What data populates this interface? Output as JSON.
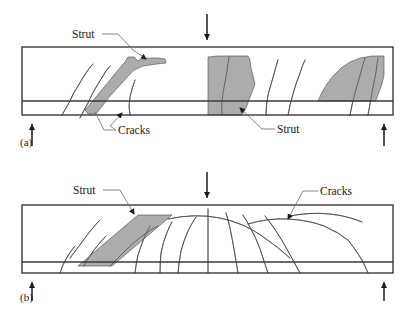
{
  "figure": {
    "type": "engineering-diagram",
    "colors": {
      "strut_fill": "#a8a8a8",
      "strut_stroke": "#4a4a4a",
      "beam_outline": "#3a3a3a",
      "crack_line": "#5a5a5a",
      "arrow": "#1a1a1a",
      "leader": "#6a6a6a",
      "text": "#1a1a1a",
      "background": "#ffffff"
    },
    "panels": [
      {
        "id": "a",
        "caption": "(a)",
        "caption_x": 20,
        "caption_y": 146,
        "beam": {
          "x": 22,
          "y": 47,
          "width": 371,
          "height": 68,
          "rebar_y": 101
        },
        "load_arrow": {
          "x": 207,
          "y_top": 14,
          "y_bottom": 46
        },
        "supports": [
          {
            "x": 32,
            "y_top": 146,
            "y_bottom": 118
          },
          {
            "x": 384,
            "y_top": 146,
            "y_bottom": 118
          }
        ],
        "labels": [
          {
            "text": "Strut",
            "x": 72,
            "y": 38,
            "name": "strut-label-a-top",
            "leader": "M102,34 L118,34 L133,50 L146,59"
          },
          {
            "text": "Cracks",
            "x": 118,
            "y": 134,
            "name": "cracks-label-a",
            "leader": "M116,130 L104,130 L95,112 M116,130 L110,126 L122,113"
          },
          {
            "text": "Strut",
            "x": 277,
            "y": 133,
            "name": "strut-label-a-bottom",
            "leader": "M275,129 L262,129 L240,108"
          }
        ],
        "struts": [
          {
            "name": "strut-band-left",
            "path": "M88,114 L96,114 L110,96 L121,84 L128,76 L134,70 L143,66 L150,65 L157,64 L166,63 L165,59 L159,58 L150,58 L142,59 L138,61 L134,57 L128,57 L125,62 L118,70 L110,80 L100,92 L92,102 L85,110 Z"
          },
          {
            "name": "strut-band-middle",
            "path": "M208,57 L208,115 L242,115 L246,108 L249,100 L252,92 L255,84 L253,76 L251,68 L250,60 L248,56 L238,56 L228,56 L218,56 Z"
          },
          {
            "name": "strut-band-right",
            "path": "M318,101 L322,92 L327,84 L333,76 L341,68 L350,62 L360,58 L372,56 L384,56 L384,75 L382,84 L379,92 L376,100 L374,101 Z"
          }
        ],
        "cracks": [
          {
            "name": "crack-a-1",
            "path": "M62,115 Q66,108 70,101 Q73,93 78,86 Q82,79 86,73 Q89,68 93,64"
          },
          {
            "name": "crack-a-2",
            "path": "M80,118 Q84,110 88,103 Q91,96 95,89 Q99,82 103,76 Q106,70 110,66"
          },
          {
            "name": "crack-a-3",
            "path": "M130,115 Q128,106 130,97 Q132,88 135,80"
          },
          {
            "name": "crack-a-4",
            "path": "M222,115 Q221,104 223,93 Q225,82 227,71 Q228,63 229,57"
          },
          {
            "name": "crack-a-5",
            "path": "M266,115 Q266,105 268,95 Q271,84 274,74 Q276,66 278,60"
          },
          {
            "name": "crack-a-6",
            "path": "M288,115 Q290,104 293,94 Q296,83 300,73 Q302,66 305,60"
          },
          {
            "name": "crack-a-7",
            "path": "M350,115 Q352,104 355,93 Q358,82 361,72 Q363,64 365,58"
          },
          {
            "name": "crack-a-8",
            "path": "M368,115 Q370,104 372,93 Q374,82 376,72 Q377,64 378,58"
          }
        ]
      },
      {
        "id": "b",
        "caption": "(b)",
        "caption_x": 20,
        "caption_y": 301,
        "beam": {
          "x": 22,
          "y": 205,
          "width": 371,
          "height": 68,
          "rebar_y": 262
        },
        "load_arrow": {
          "x": 207,
          "y_top": 172,
          "y_bottom": 204
        },
        "supports": [
          {
            "x": 32,
            "y_top": 301,
            "y_bottom": 276
          },
          {
            "x": 384,
            "y_top": 301,
            "y_bottom": 276
          }
        ],
        "labels": [
          {
            "text": "Strut",
            "x": 73,
            "y": 194,
            "name": "strut-label-b",
            "leader": "M103,190 L120,190 L134,214"
          },
          {
            "text": "Cracks",
            "x": 320,
            "y": 195,
            "name": "cracks-label-b",
            "leader": "M318,191 L303,191 L288,219"
          }
        ],
        "struts": [
          {
            "name": "strut-parallelogram-b",
            "path": "M78,266 L138,215 L172,215 L112,266 Z"
          }
        ],
        "cracks": [
          {
            "name": "crack-b-fan-1",
            "path": "M60,273 Q62,266 66,259 Q70,252 75,246"
          },
          {
            "name": "crack-b-fan-2",
            "path": "M135,273 Q136,264 138,255 Q141,246 144,238 Q147,231 150,226"
          },
          {
            "name": "crack-b-fan-3",
            "path": "M160,273 Q160,263 161,253 Q163,243 166,235 Q169,227 172,222"
          },
          {
            "name": "crack-b-fan-4",
            "path": "M178,273 Q179,262 181,251 Q184,240 188,231 Q192,223 196,217"
          },
          {
            "name": "crack-b-fan-5",
            "path": "M208,273 Q208,260 208,247 Q208,234 208,222 Q208,214 208,209"
          },
          {
            "name": "crack-b-fan-6",
            "path": "M238,273 Q236,261 234,249 Q232,238 230,228 Q228,219 226,213"
          },
          {
            "name": "crack-b-fan-7",
            "path": "M268,273 Q264,261 260,249 Q256,238 251,229 Q247,221 243,215"
          },
          {
            "name": "crack-b-fan-8",
            "path": "M300,273 Q294,262 288,251 Q282,240 276,231 Q270,222 265,216"
          },
          {
            "name": "crack-b-arc-1",
            "path": "M168,219 Q195,213 220,218 Q244,223 262,236 Q278,247 290,258"
          },
          {
            "name": "crack-b-arc-2",
            "path": "M248,224 Q268,218 288,219 Q308,220 324,226 Q338,232 348,240"
          },
          {
            "name": "crack-b-arc-3",
            "path": "M290,216 Q310,212 330,214 Q348,216 362,222"
          },
          {
            "name": "crack-b-tail-1",
            "path": "M348,240 Q356,250 362,260 Q366,268 368,273"
          },
          {
            "name": "crack-b-left-1",
            "path": "M70,258 Q76,250 82,242 Q87,235 92,229 Q96,224 100,220"
          },
          {
            "name": "crack-b-left-2",
            "path": "M84,266 Q88,258 94,250 Q100,242 106,236"
          },
          {
            "name": "crack-b-left-3",
            "path": "M110,266 Q118,258 126,250 Q134,242 142,236 Q150,230 158,226"
          }
        ]
      }
    ]
  }
}
